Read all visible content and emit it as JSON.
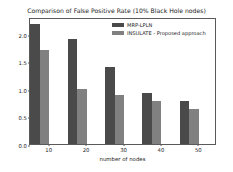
{
  "chart_data": {
    "type": "bar",
    "title": "Comparison of False Positive Rate (10% Black Hole nodes)",
    "xlabel": "number of nodes",
    "ylabel": "False Positive Rate",
    "categories": [
      "10",
      "20",
      "30",
      "40",
      "50"
    ],
    "x": [
      10,
      20,
      30,
      40,
      50
    ],
    "xlim": [
      5,
      55
    ],
    "ylim": [
      0.0,
      2.3
    ],
    "xticks": [
      "10",
      "20",
      "30",
      "40",
      "50"
    ],
    "yticks": [
      "0.0",
      "0.5",
      "1.0",
      "1.5",
      "2.0"
    ],
    "grid": false,
    "legend_position": "upper right",
    "series": [
      {
        "name": "MRP-LPLN",
        "color": "#4a4a4a",
        "values": [
          2.18,
          1.9,
          1.4,
          0.92,
          0.78
        ]
      },
      {
        "name": "INSULATE - Proposed approach",
        "color": "#808080",
        "values": [
          1.7,
          1.0,
          0.89,
          0.77,
          0.64
        ]
      }
    ]
  }
}
